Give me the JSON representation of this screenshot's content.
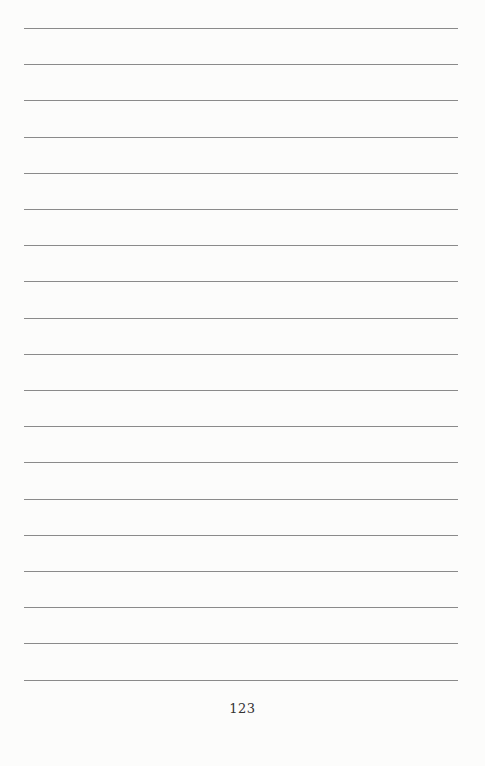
{
  "page": {
    "type": "ruled notebook page",
    "line_count": 19,
    "line_color": "#8a8a8a",
    "background": "#fcfcfb",
    "page_number": "123"
  }
}
